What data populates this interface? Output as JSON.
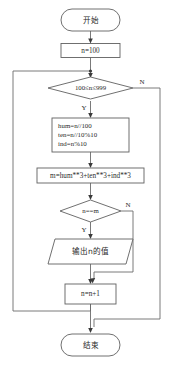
{
  "diagram": {
    "colors": {
      "background": "#ffffff",
      "shape_stroke": "#606060",
      "connector_stroke": "#6b6b6b",
      "text": "#2a2a2a"
    },
    "nodes": {
      "start": {
        "type": "terminator",
        "label": "开始"
      },
      "init": {
        "type": "process",
        "label": "n=100"
      },
      "range_check": {
        "type": "decision",
        "label": "100≤n≤999",
        "yes_label": "Y",
        "no_label": "N"
      },
      "digits": {
        "type": "process",
        "line1": "hum=n//100",
        "line2": "ten=n//10%10",
        "line3": "ind=n%10"
      },
      "cube_sum": {
        "type": "process",
        "label": "m=hum**3+ten**3+ind**3"
      },
      "equal_check": {
        "type": "decision",
        "label": "n==m",
        "yes_label": "Y",
        "no_label": "N"
      },
      "output": {
        "type": "input-output",
        "label": "输出n的值"
      },
      "increment": {
        "type": "process",
        "label": "n=n+1"
      },
      "end": {
        "type": "terminator",
        "label": "结束"
      }
    }
  }
}
